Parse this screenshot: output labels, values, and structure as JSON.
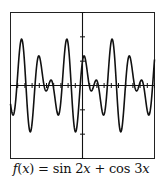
{
  "chart_data": {
    "type": "line",
    "title": "",
    "caption": "f(x) = sin 2x + cos 3x",
    "function": "sin(2x) + cos(3x)",
    "xlabel": "",
    "ylabel": "",
    "xlim": [
      -10,
      10
    ],
    "ylim": [
      -3,
      3
    ],
    "x_tick_step": 1,
    "y_tick_step": 1,
    "grid": false,
    "series": [
      {
        "name": "f(x)",
        "x": [
          -10,
          -9,
          -8,
          -7,
          -6,
          -5,
          -4,
          -3,
          -2,
          -1,
          0,
          1,
          2,
          3,
          4,
          5,
          6,
          7,
          8,
          9,
          10
        ],
        "values": [
          0.07,
          -0.25,
          -0.04,
          1.53,
          1.2,
          -0.22,
          0.01,
          -1.19,
          -0.2,
          -1.9,
          1.0,
          -0.08,
          -0.0,
          -0.63,
          0.14,
          -0.3,
          0.12,
          -0.44,
          -1.25,
          0.26,
          1.07
        ]
      }
    ],
    "colors": {
      "line": "#111111",
      "axes": "#111111",
      "frame": "#222222",
      "background": "#ffffff"
    }
  },
  "caption": {
    "f": "f",
    "open": "(",
    "x1": "x",
    "mid": ") = sin 2",
    "x2": "x",
    "plus": " + cos 3",
    "x3": "x"
  }
}
